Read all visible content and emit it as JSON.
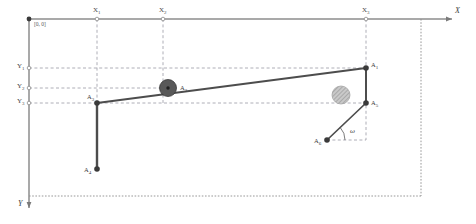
{
  "figure": {
    "kind": "mechanism-kinematic-diagram",
    "background_color": "#ffffff",
    "frame_color": "#8c8c8c",
    "link_color": "#4d4d4d",
    "gridline_color": "#9a9aa5",
    "node_color": "#3a3a3a"
  },
  "axes": {
    "x_label": "X",
    "y_label": "Y",
    "origin_label": "[0, 0]",
    "x_ticks": [
      {
        "label": "X",
        "sub": "1",
        "x": 97
      },
      {
        "label": "X",
        "sub": "2",
        "x": 163
      },
      {
        "label": "X",
        "sub": "3",
        "x": 366
      }
    ],
    "y_ticks": [
      {
        "label": "Y",
        "sub": "1",
        "y": 68
      },
      {
        "label": "Y",
        "sub": "2",
        "y": 88
      },
      {
        "label": "Y",
        "sub": "3",
        "y": 103
      }
    ]
  },
  "nodes": [
    {
      "name": "A",
      "sub": "1",
      "x": 366,
      "y": 68,
      "type": "pin",
      "label_dx": 5,
      "label_dy": -6
    },
    {
      "name": "A",
      "sub": "2",
      "x": 168,
      "y": 88,
      "type": "roller-dark",
      "label_dx": 12,
      "label_dy": -3
    },
    {
      "name": "A",
      "sub": "3",
      "x": 97,
      "y": 103,
      "type": "pin",
      "label_dx": -10,
      "label_dy": -9
    },
    {
      "name": "A",
      "sub": "4",
      "x": 97,
      "y": 169,
      "type": "pin",
      "label_dx": -11,
      "label_dy": -2
    },
    {
      "name": "A",
      "sub": "5",
      "x": 366,
      "y": 103,
      "type": "pin",
      "label_dx": 5,
      "label_dy": -3
    },
    {
      "name": "A",
      "sub": "6",
      "x": 327,
      "y": 140,
      "type": "pin",
      "label_dx": -11,
      "label_dy": -2
    }
  ],
  "links": [
    {
      "from": "A3",
      "to": "A1",
      "style": "beam"
    },
    {
      "from": "A3",
      "to": "A4",
      "style": "column"
    },
    {
      "from": "A1",
      "to": "A5",
      "style": "column"
    },
    {
      "from": "A6",
      "to": "A1",
      "style": "brace"
    }
  ],
  "hatched_circle": {
    "cx": 341,
    "cy": 95,
    "r": 9,
    "fill": "#b4b4b4"
  },
  "angle": {
    "symbol": "ω",
    "vertex": "A6",
    "x": 352,
    "y": 131
  },
  "origin_point": {
    "x": 29,
    "y": 19
  }
}
